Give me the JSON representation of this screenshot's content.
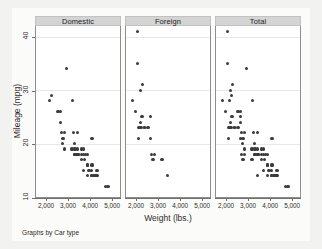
{
  "chart_data": {
    "type": "scatter",
    "title": "",
    "subtitle": "",
    "xlabel": "Weight (lbs.)",
    "ylabel": "Mileage (mpg)",
    "note": "Graphs by Car type",
    "xlim": [
      1500,
      5400
    ],
    "ylim": [
      10,
      42
    ],
    "xticks": [
      2000,
      3000,
      4000,
      5000
    ],
    "xticklabels": [
      "2,000",
      "3,000",
      "4,000",
      "5,000"
    ],
    "yticks": [
      10,
      20,
      30,
      40
    ],
    "yticklabels": [
      "10",
      "20",
      "30",
      "40"
    ],
    "grid": "horizontal",
    "legend": "none",
    "marker_color": "#3b3b3b",
    "header_color": "#d4d4d4",
    "panel_bg": "#ffffff",
    "figure_bg": "#f2f2f0",
    "gridline_color": "#e8e8e6",
    "panels": [
      {
        "label": "Domestic",
        "n": 52,
        "points": [
          [
            2930,
            34
          ],
          [
            2230,
            29
          ],
          [
            2110,
            28
          ],
          [
            2650,
            26
          ],
          [
            2520,
            26
          ],
          [
            2640,
            24
          ],
          [
            3180,
            28
          ],
          [
            2830,
            22
          ],
          [
            3250,
            22
          ],
          [
            3420,
            22
          ],
          [
            2670,
            22
          ],
          [
            2730,
            20
          ],
          [
            3280,
            20
          ],
          [
            4060,
            21
          ],
          [
            4130,
            21
          ],
          [
            2750,
            21
          ],
          [
            3170,
            19
          ],
          [
            3350,
            19
          ],
          [
            3430,
            19
          ],
          [
            3600,
            19
          ],
          [
            3690,
            19
          ],
          [
            3310,
            18
          ],
          [
            3420,
            18
          ],
          [
            3700,
            18
          ],
          [
            3900,
            18
          ],
          [
            3280,
            18
          ],
          [
            3470,
            18
          ],
          [
            3600,
            17
          ],
          [
            3740,
            17
          ],
          [
            3880,
            16
          ],
          [
            3900,
            16
          ],
          [
            4080,
            16
          ],
          [
            4130,
            16
          ],
          [
            3720,
            15
          ],
          [
            4060,
            15
          ],
          [
            4330,
            15
          ],
          [
            4290,
            14
          ],
          [
            4080,
            14
          ],
          [
            4190,
            14
          ],
          [
            3900,
            14
          ],
          [
            4060,
            14
          ],
          [
            4330,
            14
          ],
          [
            4720,
            12
          ],
          [
            4840,
            12
          ],
          [
            3800,
            18
          ],
          [
            3470,
            18
          ],
          [
            3380,
            18
          ],
          [
            3600,
            18
          ],
          [
            2830,
            19
          ],
          [
            3280,
            19
          ],
          [
            3960,
            15
          ],
          [
            4250,
            14
          ]
        ]
      },
      {
        "label": "Foreign",
        "n": 22,
        "points": [
          [
            2020,
            41
          ],
          [
            2050,
            35
          ],
          [
            2280,
            31
          ],
          [
            2160,
            30
          ],
          [
            1800,
            28
          ],
          [
            1930,
            26
          ],
          [
            2240,
            25
          ],
          [
            2650,
            25
          ],
          [
            2160,
            24
          ],
          [
            2370,
            23
          ],
          [
            2520,
            23
          ],
          [
            2200,
            23
          ],
          [
            2070,
            23
          ],
          [
            2150,
            23
          ],
          [
            2650,
            21
          ],
          [
            2070,
            21
          ],
          [
            2690,
            18
          ],
          [
            2830,
            18
          ],
          [
            2750,
            17
          ],
          [
            3170,
            17
          ],
          [
            2370,
            23
          ],
          [
            3420,
            14
          ]
        ]
      },
      {
        "label": "Total",
        "n": 74,
        "points": [
          [
            2020,
            41
          ],
          [
            2050,
            35
          ],
          [
            2930,
            34
          ],
          [
            2280,
            31
          ],
          [
            2160,
            30
          ],
          [
            2230,
            29
          ],
          [
            1800,
            28
          ],
          [
            2110,
            28
          ],
          [
            3180,
            28
          ],
          [
            1930,
            26
          ],
          [
            2650,
            26
          ],
          [
            2520,
            26
          ],
          [
            2240,
            25
          ],
          [
            2650,
            25
          ],
          [
            2640,
            24
          ],
          [
            2160,
            24
          ],
          [
            2370,
            23
          ],
          [
            2520,
            23
          ],
          [
            2200,
            23
          ],
          [
            2070,
            23
          ],
          [
            2150,
            23
          ],
          [
            2830,
            22
          ],
          [
            3250,
            22
          ],
          [
            3420,
            22
          ],
          [
            2670,
            22
          ],
          [
            2650,
            21
          ],
          [
            2070,
            21
          ],
          [
            4060,
            21
          ],
          [
            4130,
            21
          ],
          [
            2750,
            21
          ],
          [
            2730,
            20
          ],
          [
            3280,
            20
          ],
          [
            3170,
            19
          ],
          [
            3350,
            19
          ],
          [
            3430,
            19
          ],
          [
            3600,
            19
          ],
          [
            3690,
            19
          ],
          [
            2830,
            19
          ],
          [
            3280,
            19
          ],
          [
            3310,
            18
          ],
          [
            3420,
            18
          ],
          [
            3700,
            18
          ],
          [
            3900,
            18
          ],
          [
            3280,
            18
          ],
          [
            3470,
            18
          ],
          [
            3800,
            18
          ],
          [
            3380,
            18
          ],
          [
            3600,
            18
          ],
          [
            2690,
            18
          ],
          [
            2830,
            18
          ],
          [
            3600,
            17
          ],
          [
            3740,
            17
          ],
          [
            2750,
            17
          ],
          [
            3170,
            17
          ],
          [
            3880,
            16
          ],
          [
            3900,
            16
          ],
          [
            4080,
            16
          ],
          [
            4130,
            16
          ],
          [
            3720,
            15
          ],
          [
            4060,
            15
          ],
          [
            4330,
            15
          ],
          [
            3960,
            15
          ],
          [
            4290,
            14
          ],
          [
            4080,
            14
          ],
          [
            4190,
            14
          ],
          [
            3900,
            14
          ],
          [
            4060,
            14
          ],
          [
            4330,
            14
          ],
          [
            4250,
            14
          ],
          [
            3420,
            14
          ],
          [
            4720,
            12
          ],
          [
            4840,
            12
          ],
          [
            3470,
            18
          ],
          [
            2370,
            23
          ]
        ]
      }
    ]
  }
}
